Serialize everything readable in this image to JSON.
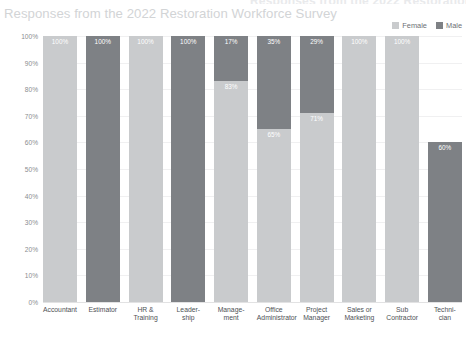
{
  "title": "Responses from the 2022 Restoration Workforce Survey",
  "subtitle": "Responses from the 2022 Restoration Workforce Survey",
  "legend": {
    "items": [
      {
        "label": "Female",
        "color": "#c9cbcd"
      },
      {
        "label": "Male",
        "color": "#7e8185"
      }
    ]
  },
  "axis": {
    "y_ticks": [
      "100%",
      "90%",
      "80%",
      "70%",
      "60%",
      "50%",
      "40%",
      "30%",
      "20%",
      "10%",
      "0%"
    ]
  },
  "chart_data": {
    "type": "bar",
    "title": "Responses from the 2022 Restoration Workforce Survey",
    "subtitle": "Responses from the 2022 Restoration Workforce Survey",
    "xlabel": "",
    "ylabel": "",
    "ylim": [
      0,
      100
    ],
    "stacked": true,
    "normalized_percent": true,
    "grid": true,
    "legend_position": "top-right",
    "categories": [
      "Accountant",
      "Estimator",
      "HR &\nTraining",
      "Leader-\nship",
      "Manage-\nment",
      "Office\nAdministrator",
      "Project\nManager",
      "Sales or\nMarketing",
      "Sub\nContractor",
      "Techni-\ncian"
    ],
    "series": [
      {
        "name": "Female",
        "color": "#c9cbcd",
        "values": [
          100,
          0,
          100,
          0,
          83,
          65,
          71,
          100,
          100,
          0
        ],
        "labels": [
          "100%",
          "",
          "100%",
          "",
          "83%",
          "65%",
          "71%",
          "100%",
          "100%",
          ""
        ]
      },
      {
        "name": "Male",
        "color": "#7e8185",
        "values": [
          0,
          100,
          0,
          100,
          17,
          35,
          29,
          0,
          0,
          60
        ],
        "labels": [
          "",
          "100%",
          "",
          "100%",
          "17%",
          "35%",
          "29%",
          "",
          "",
          "60%"
        ]
      }
    ],
    "bars": [
      {
        "category": "Accountant",
        "female": 100,
        "male": 0,
        "top_label": "100%",
        "top_series": "Female"
      },
      {
        "category": "Estimator",
        "female": 0,
        "male": 100,
        "top_label": "100%",
        "top_series": "Male"
      },
      {
        "category": "HR & Training",
        "female": 100,
        "male": 0,
        "top_label": "100%",
        "top_series": "Female"
      },
      {
        "category": "Leadership",
        "female": 0,
        "male": 100,
        "top_label": "100%",
        "top_series": "Male"
      },
      {
        "category": "Management",
        "female": 83,
        "male": 17,
        "top_label": "17%",
        "top_series": "Male"
      },
      {
        "category": "Office Administrator",
        "female": 65,
        "male": 35,
        "top_label": "35%",
        "top_series": "Male"
      },
      {
        "category": "Project Manager",
        "female": 71,
        "male": 29,
        "top_label": "29%",
        "top_series": "Male"
      },
      {
        "category": "Sales or Marketing",
        "female": 100,
        "male": 0,
        "top_label": "100%",
        "top_series": "Female"
      },
      {
        "category": "Sub Contractor",
        "female": 100,
        "male": 0,
        "top_label": "100%",
        "top_series": "Female"
      },
      {
        "category": "Technician",
        "female": 0,
        "male": 60,
        "top_label": "60%",
        "top_series": "Male"
      }
    ]
  }
}
